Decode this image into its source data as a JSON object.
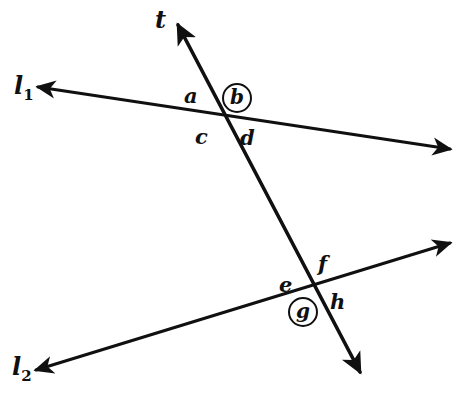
{
  "figure": {
    "kind": "two-parallel-lines-cut-by-transversal",
    "background_color": "#ffffff",
    "stroke_color": "#101010"
  },
  "lines": [
    {
      "id": "l1",
      "label": "l",
      "subscript": "1",
      "label_x": 14,
      "label_y": 74,
      "x1": 38,
      "y1": 87,
      "x2": 450,
      "y2": 149,
      "arrow_start": true,
      "arrow_end": true,
      "stroke_width": 3.0
    },
    {
      "id": "l2",
      "label": "l",
      "subscript": "2",
      "label_x": 12,
      "label_y": 355,
      "x1": 36,
      "y1": 370,
      "x2": 450,
      "y2": 243,
      "arrow_start": true,
      "arrow_end": true,
      "stroke_width": 3.0
    },
    {
      "id": "t",
      "label": "t",
      "subscript": "",
      "label_x": 155,
      "label_y": 8,
      "x1": 178,
      "y1": 25,
      "x2": 360,
      "y2": 372,
      "arrow_start": true,
      "arrow_end": true,
      "stroke_width": 3.6
    }
  ],
  "intersections": [
    {
      "id": "upper-intersection",
      "x": 222,
      "y": 117,
      "lines": "l1,t"
    },
    {
      "id": "lower-intersection",
      "x": 313,
      "y": 292,
      "lines": "l2,t"
    }
  ],
  "angle_labels": [
    {
      "id": "a",
      "text": "a",
      "x": 184,
      "y": 85,
      "circled": false
    },
    {
      "id": "b",
      "text": "b",
      "x": 222,
      "y": 83,
      "circled": true
    },
    {
      "id": "c",
      "text": "c",
      "x": 195,
      "y": 126,
      "circled": false
    },
    {
      "id": "d",
      "text": "d",
      "x": 240,
      "y": 127,
      "circled": false
    },
    {
      "id": "e",
      "text": "e",
      "x": 279,
      "y": 274,
      "circled": false
    },
    {
      "id": "f",
      "text": "f",
      "x": 318,
      "y": 253,
      "circled": false
    },
    {
      "id": "g",
      "text": "g",
      "x": 288,
      "y": 297,
      "circled": true
    },
    {
      "id": "h",
      "text": "h",
      "x": 330,
      "y": 291,
      "circled": false
    }
  ]
}
